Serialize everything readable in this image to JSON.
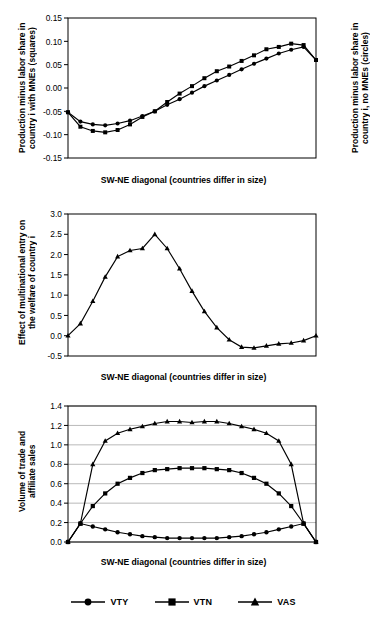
{
  "chart_data": [
    {
      "type": "line",
      "title": "",
      "xlabel": "SW-NE diagonal  (countries differ in size)",
      "ylabel_left": "Production minus labor share in\ncountry i with MNEs (squares)",
      "ylabel_right": "Production minus labor share in\ncountry i, no MNEs (circles)",
      "ylim": [
        -0.15,
        0.15
      ],
      "yticks": [
        -0.15,
        -0.1,
        -0.05,
        0.0,
        0.05,
        0.1,
        0.15
      ],
      "ytick_labels": [
        "-0.15",
        "-0.10",
        "-0.05",
        "0.00",
        "0.05",
        "0.10",
        "0.15"
      ],
      "grid": false,
      "x": [
        1,
        2,
        3,
        4,
        5,
        6,
        7,
        8,
        9,
        10,
        11,
        12,
        13,
        14,
        15,
        16,
        17,
        18,
        19,
        20,
        21
      ],
      "series": [
        {
          "name": "squares",
          "marker": "square",
          "values": [
            -0.052,
            -0.083,
            -0.092,
            -0.095,
            -0.09,
            -0.078,
            -0.062,
            -0.05,
            -0.03,
            -0.012,
            0.004,
            0.021,
            0.036,
            0.046,
            0.058,
            0.07,
            0.083,
            0.088,
            0.095,
            0.092,
            0.06
          ]
        },
        {
          "name": "circles",
          "marker": "circle",
          "values": [
            -0.052,
            -0.072,
            -0.078,
            -0.08,
            -0.076,
            -0.07,
            -0.06,
            -0.05,
            -0.036,
            -0.024,
            -0.01,
            0.004,
            0.016,
            0.028,
            0.04,
            0.052,
            0.063,
            0.074,
            0.082,
            0.088,
            0.06
          ]
        }
      ]
    },
    {
      "type": "line",
      "title": "",
      "xlabel": "SW-NE diagonal  (countries differ in size)",
      "ylabel_left": "Effect of multinational entry on\nthe welfare of country i",
      "ylim": [
        -0.5,
        3.0
      ],
      "yticks": [
        -0.5,
        0.0,
        0.5,
        1.0,
        1.5,
        2.0,
        2.5,
        3.0
      ],
      "ytick_labels": [
        "-0.5",
        "0.0",
        "0.5",
        "1.0",
        "1.5",
        "2.0",
        "2.5",
        "3.0"
      ],
      "grid": false,
      "x": [
        1,
        2,
        3,
        4,
        5,
        6,
        7,
        8,
        9,
        10,
        11,
        12,
        13,
        14,
        15,
        16,
        17,
        18,
        19,
        20,
        21
      ],
      "series": [
        {
          "name": "welfare-effect",
          "marker": "triangle",
          "values": [
            0.0,
            0.3,
            0.85,
            1.45,
            1.95,
            2.1,
            2.15,
            2.5,
            2.15,
            1.65,
            1.1,
            0.6,
            0.2,
            -0.1,
            -0.28,
            -0.3,
            -0.25,
            -0.2,
            -0.18,
            -0.12,
            0.0
          ]
        }
      ]
    },
    {
      "type": "line",
      "title": "",
      "xlabel": "SW-NE diagonal  (countries differ in size)",
      "ylabel_left": "Volume of trade and\naffiliate sales",
      "ylim": [
        0.0,
        1.4
      ],
      "yticks": [
        0.0,
        0.2,
        0.4,
        0.6,
        0.8,
        1.0,
        1.2,
        1.4
      ],
      "ytick_labels": [
        "0.0",
        "0.2",
        "0.4",
        "0.6",
        "0.8",
        "1.0",
        "1.2",
        "1.4"
      ],
      "grid": true,
      "x": [
        1,
        2,
        3,
        4,
        5,
        6,
        7,
        8,
        9,
        10,
        11,
        12,
        13,
        14,
        15,
        16,
        17,
        18,
        19,
        20,
        21
      ],
      "series": [
        {
          "name": "VTY",
          "marker": "circle",
          "values": [
            0.0,
            0.19,
            0.16,
            0.13,
            0.1,
            0.08,
            0.06,
            0.05,
            0.04,
            0.04,
            0.04,
            0.04,
            0.04,
            0.05,
            0.06,
            0.08,
            0.1,
            0.13,
            0.16,
            0.19,
            0.0
          ]
        },
        {
          "name": "VTN",
          "marker": "square",
          "values": [
            0.0,
            0.19,
            0.37,
            0.5,
            0.6,
            0.66,
            0.71,
            0.74,
            0.75,
            0.76,
            0.76,
            0.76,
            0.75,
            0.74,
            0.71,
            0.66,
            0.6,
            0.5,
            0.37,
            0.19,
            0.0
          ]
        },
        {
          "name": "VAS",
          "marker": "triangle",
          "values": [
            0.0,
            0.19,
            0.8,
            1.04,
            1.12,
            1.16,
            1.19,
            1.22,
            1.24,
            1.24,
            1.23,
            1.24,
            1.24,
            1.22,
            1.19,
            1.16,
            1.12,
            1.04,
            0.8,
            0.19,
            0.0
          ]
        }
      ],
      "legend": [
        "VTY",
        "VTN",
        "VAS"
      ],
      "legend_position": "bottom-center"
    }
  ],
  "panels": {
    "p1": {
      "ylabel_left_line1": "Production minus labor share in",
      "ylabel_left_line2": "country i with MNEs (squares)",
      "ylabel_right_line1": "Production minus labor share in",
      "ylabel_right_line2": "country i, no MNEs (circles)",
      "xlabel": "SW-NE diagonal  (countries differ in size)"
    },
    "p2": {
      "ylabel_left_line1": "Effect of multinational entry on",
      "ylabel_left_line2": "the welfare of country i",
      "xlabel": "SW-NE diagonal  (countries differ in size)"
    },
    "p3": {
      "ylabel_left_line1": "Volume of trade and",
      "ylabel_left_line2": "affiliate sales",
      "xlabel": "SW-NE diagonal  (countries differ in size)"
    }
  },
  "legend": {
    "items": [
      {
        "label": "VTY",
        "marker": "circle"
      },
      {
        "label": "VTN",
        "marker": "square"
      },
      {
        "label": "VAS",
        "marker": "triangle"
      }
    ]
  },
  "colors": {
    "line": "#000000",
    "axis": "#000000",
    "grid": "#808080",
    "background": "#ffffff"
  }
}
